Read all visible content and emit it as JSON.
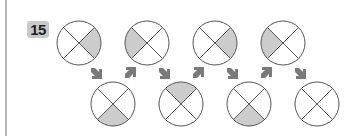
{
  "problem": {
    "number": "15",
    "colors": {
      "shade": "#cccccc",
      "stroke": "#555555",
      "arrow": "#7a7a7a",
      "badge_bg": "#c9c9c9"
    },
    "top_row": [
      {
        "shaded_quadrant": "right"
      },
      {
        "shaded_quadrant": "left"
      },
      {
        "shaded_quadrant": "right"
      },
      {
        "shaded_quadrant": "left"
      }
    ],
    "bottom_row": [
      {
        "shaded_quadrant": "bottom"
      },
      {
        "shaded_quadrant": "top"
      },
      {
        "shaded_quadrant": "bottom"
      },
      {
        "shaded_quadrant": "none",
        "is_answer_blank": true
      }
    ],
    "arrows": [
      "down-right",
      "up-right",
      "down-right",
      "up-right",
      "down-right",
      "up-right",
      "down-right"
    ]
  }
}
